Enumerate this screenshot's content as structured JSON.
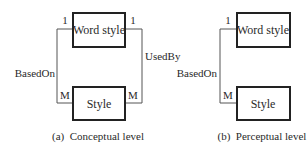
{
  "diagrams": [
    {
      "id": "a",
      "caption": "(a)  Conceptual level",
      "entities": [
        {
          "name": "word_style",
          "label": "Word style"
        },
        {
          "name": "style",
          "label": "Style"
        }
      ],
      "relationships": [
        {
          "label": "BasedOn",
          "from": "Word style",
          "to": "Style",
          "from_card": "1",
          "to_card": "M",
          "side": "left"
        },
        {
          "label": "UsedBy",
          "from": "Word style",
          "to": "Style",
          "from_card": "1",
          "to_card": "M",
          "side": "right"
        }
      ]
    },
    {
      "id": "b",
      "caption": "(b)  Perceptual level",
      "entities": [
        {
          "name": "word_style",
          "label": "Word style"
        },
        {
          "name": "style",
          "label": "Style"
        }
      ],
      "relationships": [
        {
          "label": "BasedOn",
          "from": "Word style",
          "to": "Style",
          "from_card": "1",
          "to_card": "M",
          "side": "left"
        }
      ]
    }
  ]
}
